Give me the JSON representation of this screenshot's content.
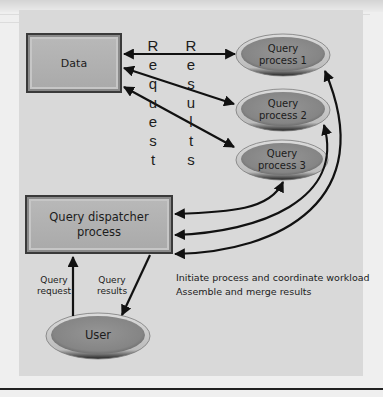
{
  "diagram": {
    "data_box": {
      "label": "Data"
    },
    "query_processes": [
      {
        "label_line1": "Query",
        "label_line2": "process 1"
      },
      {
        "label_line1": "Query",
        "label_line2": "process 2"
      },
      {
        "label_line1": "Query",
        "label_line2": "process 3"
      }
    ],
    "request_column": {
      "word": "Request",
      "letters": [
        "R",
        "e",
        "q",
        "u",
        "e",
        "s",
        "t"
      ]
    },
    "results_column": {
      "word": "Results",
      "letters": [
        "R",
        "e",
        "s",
        "u",
        "l",
        "t",
        "s"
      ]
    },
    "dispatcher_box": {
      "label_line1": "Query dispatcher",
      "label_line2": "process"
    },
    "user": {
      "label": "User"
    },
    "query_request_label": {
      "line1": "Query",
      "line2": "request"
    },
    "query_results_label": {
      "line1": "Query",
      "line2": "results"
    },
    "caption": {
      "line1": "Initiate process and coordinate workload",
      "line2": "Assemble and merge results"
    },
    "colors": {
      "panel_background": "#d9d9d9",
      "box_fill": "#b0b0b0",
      "ellipse_fill": "#8a8a8a",
      "ellipse_rim": "#c8c8c8",
      "arrow": "#111111"
    }
  }
}
